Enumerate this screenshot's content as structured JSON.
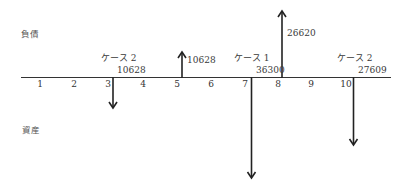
{
  "labels": {
    "liabilities": "負債",
    "assets": "資産"
  },
  "timeline": {
    "periods": [
      "1",
      "2",
      "3",
      "4",
      "5",
      "6",
      "7",
      "8",
      "9",
      "10"
    ]
  },
  "annotations": [
    {
      "case": "ケース 2",
      "value": "10628",
      "period": "3",
      "direction": "down"
    },
    {
      "case": "",
      "value": "10628",
      "period": "5",
      "direction": "up"
    },
    {
      "case": "ケース 1",
      "value": "36300",
      "period": "7",
      "direction": "down"
    },
    {
      "case": "",
      "value": "26620",
      "period": "8",
      "direction": "up"
    },
    {
      "case": "ケース 2",
      "value": "27609",
      "period": "10",
      "direction": "down"
    }
  ],
  "colors": {
    "line": "#222222",
    "text": "#333333"
  }
}
